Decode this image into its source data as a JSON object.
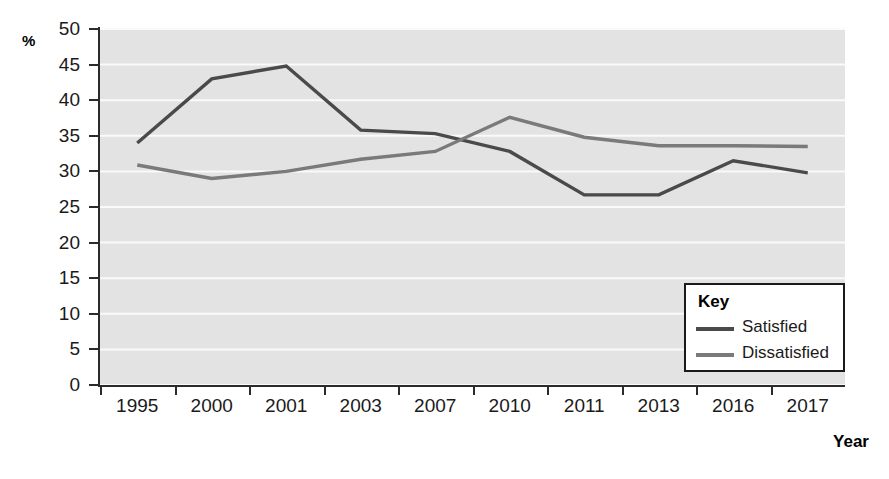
{
  "chart_data": {
    "type": "line",
    "title": "",
    "xlabel": "Year",
    "ylabel": "%",
    "categories": [
      "1995",
      "2000",
      "2001",
      "2003",
      "2007",
      "2010",
      "2011",
      "2013",
      "2016",
      "2017"
    ],
    "ylim": [
      0,
      50
    ],
    "ytick_step": 5,
    "yticks": [
      "50",
      "45",
      "40",
      "35",
      "30",
      "25",
      "20",
      "15",
      "10",
      "5",
      "0"
    ],
    "grid": "horizontal",
    "legend_position": "inside-bottom-right",
    "legend_title": "Key",
    "series": [
      {
        "name": "Satisfied",
        "color": "#4a4a4a",
        "values": [
          34.0,
          43.0,
          44.8,
          35.8,
          35.3,
          32.8,
          26.7,
          26.7,
          31.5,
          29.8
        ]
      },
      {
        "name": "Dissatisfied",
        "color": "#7a7a7a",
        "values": [
          30.9,
          29.0,
          30.0,
          31.7,
          32.8,
          37.6,
          34.8,
          33.6,
          33.6,
          33.5
        ]
      }
    ]
  },
  "colors": {
    "plot_background": "#e3e3e3",
    "gridline": "#fafafa",
    "axis": "#2b2b2b",
    "text": "#1a1a1a"
  }
}
